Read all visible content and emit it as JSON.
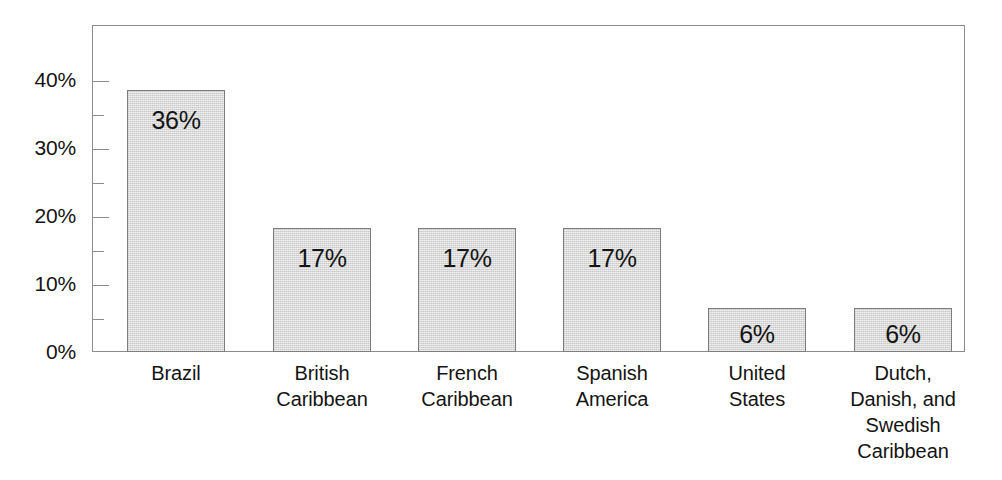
{
  "chart_data": {
    "type": "bar",
    "title": "",
    "subtitle": "",
    "xlabel": "",
    "ylabel": "",
    "ylim": [
      0,
      42
    ],
    "grid": false,
    "legend": false,
    "legend_position": "none",
    "orientation": "vertical",
    "bar_fill_color": "#d9d9d9",
    "bar_border_color": "#7d7d7d",
    "frame_color": "#8c8c8c",
    "text_color": "#141414",
    "background_color": "#ffffff",
    "categories": [
      "Brazil",
      "British Caribbean",
      "French Caribbean",
      "Spanish America",
      "United States",
      "Dutch, Danish, and Swedish Caribbean"
    ],
    "category_lines": [
      [
        "Brazil"
      ],
      [
        "British",
        "Caribbean"
      ],
      [
        "French",
        "Caribbean"
      ],
      [
        "Spanish",
        "America"
      ],
      [
        "United",
        "States"
      ],
      [
        "Dutch,",
        "Danish, and",
        "Swedish",
        "Caribbean"
      ]
    ],
    "values": [
      36,
      17,
      17,
      17,
      6,
      6
    ],
    "value_labels": [
      "36%",
      "17%",
      "17%",
      "17%",
      "6%",
      "6%"
    ],
    "y_major_ticks": [
      0,
      10,
      20,
      30,
      40
    ],
    "y_minor_ticks": [
      5,
      15,
      25,
      35
    ],
    "y_tick_labels": [
      "0%",
      "10%",
      "20%",
      "30%",
      "40%"
    ]
  }
}
